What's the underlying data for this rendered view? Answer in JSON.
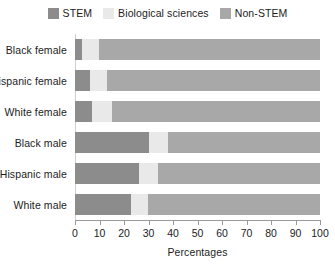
{
  "legend": {
    "position": "top-center",
    "entries": [
      {
        "label": "STEM",
        "color": "#8c8c8c",
        "swatch_name": "legend-swatch-stem"
      },
      {
        "label": "Biological sciences",
        "color": "#e9e9e9",
        "swatch_name": "legend-swatch-biological-sciences"
      },
      {
        "label": "Non-STEM",
        "color": "#a8a8a8",
        "swatch_name": "legend-swatch-non-stem"
      }
    ]
  },
  "axis": {
    "xlabel": "Percentages",
    "ticks": [
      "0",
      "10",
      "20",
      "30",
      "40",
      "50",
      "60",
      "70",
      "80",
      "90",
      "100"
    ],
    "xmin": 0,
    "xmax": 100
  },
  "chart_data": {
    "type": "bar",
    "orientation": "horizontal",
    "stacked": true,
    "normalized": true,
    "title": "",
    "xlabel": "Percentages",
    "ylabel": "",
    "xlim": [
      0,
      100
    ],
    "grid": false,
    "legend_position": "top-center",
    "categories": [
      "Black female",
      "Hispanic female",
      "White female",
      "Black male",
      "Hispanic male",
      "White male"
    ],
    "series": [
      {
        "name": "STEM",
        "color": "#8c8c8c",
        "values": [
          3,
          6,
          7,
          30,
          26,
          23
        ]
      },
      {
        "name": "Biological sciences",
        "color": "#e9e9e9",
        "values": [
          7,
          7,
          8,
          8,
          8,
          7
        ]
      },
      {
        "name": "Non-STEM",
        "color": "#a8a8a8",
        "values": [
          90,
          87,
          85,
          62,
          66,
          70
        ]
      }
    ]
  }
}
